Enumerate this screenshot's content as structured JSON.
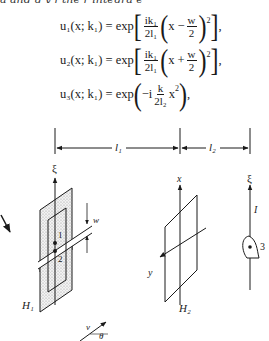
{
  "cutoff_text": "a and g y f the r integra e ",
  "equations": [
    {
      "id": "u1",
      "lhs": "u₁(x; k₁) = exp",
      "num": "ik₁",
      "den": "2l₁",
      "inner": "x − ",
      "w_num": "w",
      "w_den": "2",
      "sup": "2",
      "tail": ","
    },
    {
      "id": "u2",
      "lhs": "u₂(x; k₁) = exp",
      "num": "ik₁",
      "den": "2l₁",
      "inner": "x + ",
      "w_num": "w",
      "w_den": "2",
      "sup": "2",
      "tail": ","
    },
    {
      "id": "u3",
      "lhs": "u₃(x; k₁) = exp",
      "pre": "−i",
      "num": "k",
      "den": "2l₂",
      "post": "x",
      "sup": "2",
      "tail": ","
    }
  ],
  "diagram": {
    "distance_labels": {
      "l1": "l₁",
      "l2": "l₂"
    },
    "screen1": {
      "axis_label": "ξ",
      "name": "H₁",
      "slit1": "1",
      "slit2": "2",
      "width_label": "w"
    },
    "screen2": {
      "axis_x": "x",
      "axis_y": "y",
      "name": "H₂"
    },
    "detector": {
      "axis_label": "ξ",
      "direction_label": "I",
      "point_label": "3"
    },
    "velocity": {
      "v_label": "v",
      "angle_label": "θ"
    }
  }
}
